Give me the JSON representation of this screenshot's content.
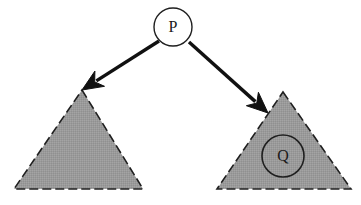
{
  "diagram": {
    "background_color": "#ffffff",
    "stroke_color": "#1f1f1f",
    "fill_color": "#9a9a9a",
    "arrow_color": "#111111"
  },
  "nodes": {
    "root": {
      "label": "P",
      "shape": "circle",
      "cx": 173,
      "cy": 27,
      "r": 19,
      "fill": "#ffffff"
    },
    "inner": {
      "label": "Q",
      "shape": "circle",
      "cx": 283,
      "cy": 156,
      "r": 21,
      "fill": "none"
    }
  },
  "subtrees": {
    "left": {
      "name": "left-subtree",
      "shape": "triangle",
      "apex_x": 82,
      "apex_y": 90,
      "base_left_x": 14,
      "base_right_x": 143,
      "base_y": 189,
      "fill": "#9a9a9a"
    },
    "right": {
      "name": "right-subtree",
      "shape": "triangle",
      "apex_x": 283,
      "apex_y": 92,
      "base_left_x": 217,
      "base_right_x": 351,
      "base_y": 189,
      "fill": "#9a9a9a"
    }
  },
  "edges": [
    {
      "name": "edge-root-to-left",
      "from": "P",
      "to": "left-subtree",
      "x1": 159,
      "y1": 41,
      "x2": 82,
      "y2": 90,
      "arrow": "end"
    },
    {
      "name": "edge-root-to-right",
      "from": "P",
      "to": "right-subtree",
      "x1": 189,
      "y1": 42,
      "x2": 268,
      "y2": 113,
      "arrow": "end"
    }
  ]
}
